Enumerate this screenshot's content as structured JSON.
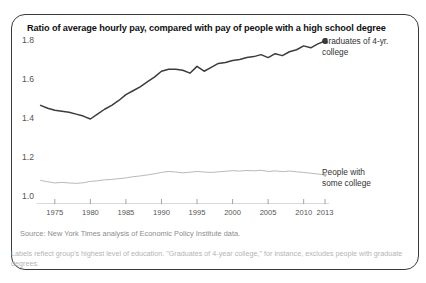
{
  "title": "Ratio of average hourly pay, compared with pay of people with a high school degree",
  "source": "Source: New York Times analysis of Economic Policy Institute data.",
  "note": "Labels reflect group's highest level of education. \"Graduates of 4-year college,\" for instance, excludes people with graduate degrees.",
  "annotations": {
    "upper_line1": "Graduates of 4-yr.",
    "upper_line2": "college",
    "lower_line1": "People with",
    "lower_line2": "some college"
  },
  "colors": {
    "upper_line": "#3c3c3c",
    "lower_line": "#b9b9b9",
    "axis_text": "#555555",
    "border": "#3a3a3a",
    "note_text": "#b4b4b4",
    "source_text": "#8c8c8c"
  },
  "chart_data": {
    "type": "line",
    "title": "Ratio of average hourly pay, compared with pay of people with a high school degree",
    "xlabel": "",
    "ylabel": "",
    "xlim": [
      1973,
      2013
    ],
    "ylim": [
      1.0,
      1.88
    ],
    "grid": false,
    "legend_position": "inline-right-annotations",
    "yticks": [
      "1.0",
      "1.2",
      "1.4",
      "1.6",
      "1.8"
    ],
    "ytick_values": [
      1.0,
      1.2,
      1.4,
      1.6,
      1.8
    ],
    "xticks": [
      "1975",
      "1980",
      "1985",
      "1990",
      "1995",
      "2000",
      "2005",
      "2010",
      "2013"
    ],
    "xtick_values": [
      1975,
      1980,
      1985,
      1990,
      1995,
      2000,
      2005,
      2010,
      2013
    ],
    "x": [
      1973,
      1974,
      1975,
      1976,
      1977,
      1978,
      1979,
      1980,
      1981,
      1982,
      1983,
      1984,
      1985,
      1986,
      1987,
      1988,
      1989,
      1990,
      1991,
      1992,
      1993,
      1994,
      1995,
      1996,
      1997,
      1998,
      1999,
      2000,
      2001,
      2002,
      2003,
      2004,
      2005,
      2006,
      2007,
      2008,
      2009,
      2010,
      2011,
      2012,
      2013
    ],
    "series": [
      {
        "name": "Graduates of 4-yr. college",
        "color": "#3c3c3c",
        "end_marker": true,
        "values": [
          1.47,
          1.455,
          1.445,
          1.44,
          1.435,
          1.425,
          1.415,
          1.4,
          1.425,
          1.45,
          1.47,
          1.495,
          1.525,
          1.545,
          1.565,
          1.59,
          1.615,
          1.645,
          1.655,
          1.655,
          1.65,
          1.635,
          1.67,
          1.645,
          1.665,
          1.685,
          1.69,
          1.7,
          1.705,
          1.715,
          1.72,
          1.73,
          1.715,
          1.735,
          1.725,
          1.745,
          1.755,
          1.775,
          1.765,
          1.785,
          1.8
        ]
      },
      {
        "name": "People with some college",
        "color": "#b9b9b9",
        "end_marker": true,
        "values": [
          1.085,
          1.078,
          1.072,
          1.075,
          1.072,
          1.07,
          1.073,
          1.08,
          1.083,
          1.088,
          1.09,
          1.094,
          1.098,
          1.104,
          1.108,
          1.113,
          1.119,
          1.126,
          1.131,
          1.128,
          1.124,
          1.127,
          1.131,
          1.128,
          1.126,
          1.129,
          1.132,
          1.135,
          1.133,
          1.136,
          1.134,
          1.137,
          1.131,
          1.134,
          1.13,
          1.133,
          1.129,
          1.126,
          1.122,
          1.118,
          1.113
        ]
      }
    ]
  }
}
